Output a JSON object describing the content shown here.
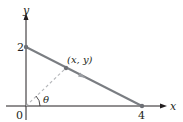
{
  "diagram": {
    "axes": {
      "x_label": "x",
      "y_label": "y",
      "origin_label": "0"
    },
    "points": {
      "y_intercept_label": "2",
      "x_intercept_label": "4",
      "moving_point_label": "(x, y)"
    },
    "angle_label": "θ",
    "colors": {
      "axis": "#231f20",
      "segment": "#7a7d82",
      "dashed": "#b5b7ba",
      "point": "#6d7076"
    }
  }
}
